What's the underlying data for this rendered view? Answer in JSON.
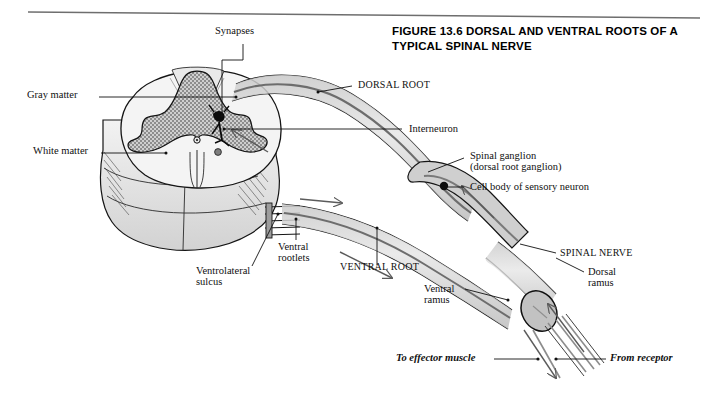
{
  "figure": {
    "title_line1": "FIGURE 13.6  DORSAL AND VENTRAL ROOTS OF A",
    "title_line2": "TYPICAL SPINAL NERVE"
  },
  "labels": {
    "synapses": "Synapses",
    "gray_matter": "Gray matter",
    "white_matter": "White matter",
    "dorsal_root": "DORSAL ROOT",
    "interneuron": "Interneuron",
    "spinal_ganglion_line1": "Spinal ganglion",
    "spinal_ganglion_line2": "(dorsal root ganglion)",
    "cell_body": "Cell body of sensory neuron",
    "spinal_nerve": "SPINAL NERVE",
    "dorsal_ramus_line1": "Dorsal",
    "dorsal_ramus_line2": "ramus",
    "ventral_ramus_line1": "Ventral",
    "ventral_ramus_line2": "ramus",
    "ventral_root": "VENTRAL ROOT",
    "ventral_rootlets_line1": "Ventral",
    "ventral_rootlets_line2": "rootlets",
    "ventrolateral_sulcus_line1": "Ventrolateral",
    "ventrolateral_sulcus_line2": "sulcus",
    "to_effector_muscle": "To effector muscle",
    "from_receptor": "From receptor"
  },
  "colors": {
    "ink": "#101010",
    "page": "#ffffff",
    "gray_matter_fill": "#b9b9b9",
    "white_matter_fill": "#f0f0f0",
    "nerve_fill": "#d6d6d6",
    "nerve_fiber": "#8a8a8a",
    "cord_shade": "#dcdcdc",
    "ganglion_fill": "#cfcfcf"
  }
}
